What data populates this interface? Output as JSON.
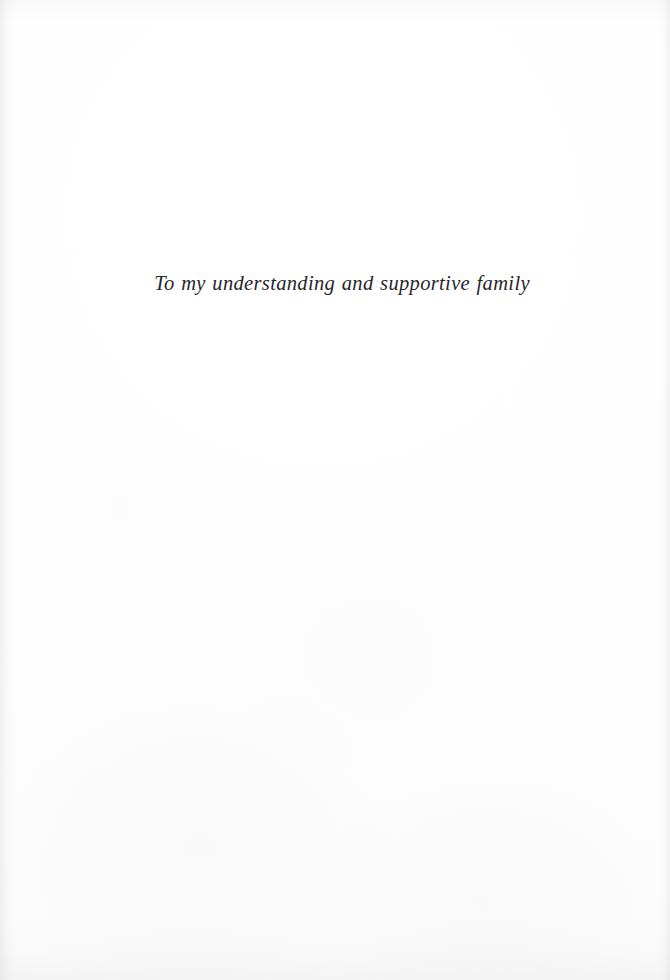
{
  "page": {
    "kind": "book-dedication-page",
    "width": 670,
    "height": 980,
    "paper_color": "#fefefe",
    "ink_color": "#28262b"
  },
  "dedication": {
    "text": "To my understanding and supportive family"
  }
}
